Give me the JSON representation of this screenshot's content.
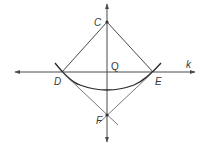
{
  "figure": {
    "type": "geometric-construction",
    "colors": {
      "stroke": "#4a4a4a",
      "arc": "#2a2a2a",
      "text": "#3a3a3a",
      "background": "#ffffff"
    },
    "points": {
      "C": {
        "label": "C",
        "x": 107,
        "y": 22
      },
      "D": {
        "label": "D",
        "x": 62,
        "y": 72
      },
      "E": {
        "label": "E",
        "x": 153,
        "y": 72
      },
      "Q": {
        "label": "Q",
        "x": 107,
        "y": 72
      },
      "F": {
        "label": "F",
        "x": 107,
        "y": 115
      }
    },
    "lines": {
      "k": {
        "label": "k",
        "from": [
          15,
          72
        ],
        "to": [
          195,
          72
        ],
        "arrows": "both"
      },
      "vertical": {
        "label": "",
        "from": [
          107,
          4
        ],
        "to": [
          107,
          142
        ],
        "arrows": "both"
      }
    },
    "segments": [
      {
        "from": "C",
        "to": "D"
      },
      {
        "from": "C",
        "to": "E"
      },
      {
        "from": "D",
        "to": "F",
        "extends_to": [
          118,
          125
        ]
      },
      {
        "from": "E",
        "to": "F",
        "extends_to": [
          99,
          123
        ]
      }
    ],
    "arcs": [
      {
        "center": "C",
        "from": [
          55,
          63
        ],
        "to": [
          161,
          63
        ],
        "through": [
          107,
          91
        ]
      }
    ]
  }
}
